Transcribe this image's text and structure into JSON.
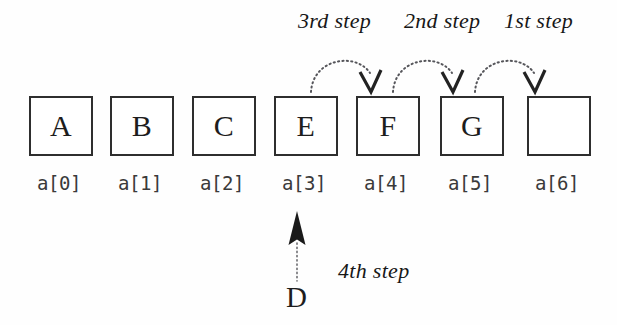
{
  "figure": {
    "title_text": "",
    "background_color": "#fefefe",
    "ink_color": "#2e2e2e"
  },
  "array": {
    "cells": [
      {
        "value": "A",
        "index_label": "a[0]",
        "empty": false
      },
      {
        "value": "B",
        "index_label": "a[1]",
        "empty": false
      },
      {
        "value": "C",
        "index_label": "a[2]",
        "empty": false
      },
      {
        "value": "E",
        "index_label": "a[3]",
        "empty": false
      },
      {
        "value": "F",
        "index_label": "a[4]",
        "empty": false
      },
      {
        "value": "G",
        "index_label": "a[5]",
        "empty": false
      },
      {
        "value": "",
        "index_label": "a[6]",
        "empty": true
      }
    ]
  },
  "shift_steps": [
    {
      "label": "3rd step",
      "from_index_label": "a[3]",
      "to_index_label": "a[4]"
    },
    {
      "label": "2nd step",
      "from_index_label": "a[4]",
      "to_index_label": "a[5]"
    },
    {
      "label": "1st step",
      "from_index_label": "a[5]",
      "to_index_label": "a[6]"
    }
  ],
  "insert_step": {
    "label": "4th step",
    "value": "D",
    "target_index_label": "a[3]"
  }
}
